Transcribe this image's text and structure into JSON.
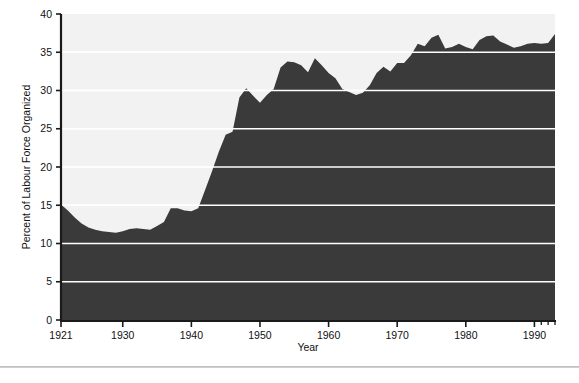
{
  "chart_data": {
    "type": "area",
    "title": "",
    "xlabel": "Year",
    "ylabel": "Percent of Labour Force Organized",
    "xlim": [
      1921,
      1993
    ],
    "ylim": [
      0,
      40
    ],
    "grid": true,
    "grid_color": "#ffffff",
    "fill_color": "#3a3a3a",
    "plot_background": "#f2f2f2",
    "legend": null,
    "xticks": [
      "1921",
      "1930",
      "1940",
      "1950",
      "1960",
      "1970",
      "1980",
      "1990"
    ],
    "xtick_values": [
      1921,
      1930,
      1940,
      1950,
      1960,
      1970,
      1980,
      1990
    ],
    "yticks": [
      "0",
      "5",
      "10",
      "15",
      "20",
      "25",
      "30",
      "35",
      "40"
    ],
    "ytick_values": [
      0,
      5,
      10,
      15,
      20,
      25,
      30,
      35,
      40
    ],
    "x": [
      1921,
      1922,
      1923,
      1924,
      1925,
      1926,
      1927,
      1928,
      1929,
      1930,
      1931,
      1932,
      1933,
      1934,
      1935,
      1936,
      1937,
      1938,
      1939,
      1940,
      1941,
      1942,
      1943,
      1944,
      1945,
      1946,
      1947,
      1948,
      1949,
      1950,
      1951,
      1952,
      1953,
      1954,
      1955,
      1956,
      1957,
      1958,
      1959,
      1960,
      1961,
      1962,
      1963,
      1964,
      1965,
      1966,
      1967,
      1968,
      1969,
      1970,
      1971,
      1972,
      1973,
      1974,
      1975,
      1976,
      1977,
      1978,
      1979,
      1980,
      1981,
      1982,
      1983,
      1984,
      1985,
      1986,
      1987,
      1988,
      1989,
      1990,
      1991,
      1992,
      1993
    ],
    "values": [
      15.1,
      14.3,
      13.4,
      12.6,
      12.1,
      11.8,
      11.6,
      11.5,
      11.4,
      11.6,
      11.9,
      12.0,
      11.9,
      11.8,
      12.3,
      12.8,
      14.6,
      14.6,
      14.3,
      14.2,
      14.6,
      17.0,
      19.4,
      22.0,
      24.2,
      24.6,
      29.1,
      30.3,
      29.3,
      28.4,
      29.4,
      30.2,
      33.0,
      33.8,
      33.7,
      33.3,
      32.4,
      34.2,
      33.3,
      32.3,
      31.6,
      30.2,
      29.8,
      29.4,
      29.7,
      30.7,
      32.3,
      33.1,
      32.5,
      33.6,
      33.6,
      34.6,
      36.1,
      35.8,
      36.9,
      37.3,
      35.5,
      35.7,
      36.1,
      35.7,
      35.4,
      36.6,
      37.1,
      37.2,
      36.4,
      36.0,
      35.6,
      35.8,
      36.1,
      36.2,
      36.1,
      36.2,
      37.4
    ],
    "annotations": []
  },
  "axis": {
    "y_title": "Percent of Labour Force Organized",
    "x_title": "Year"
  }
}
